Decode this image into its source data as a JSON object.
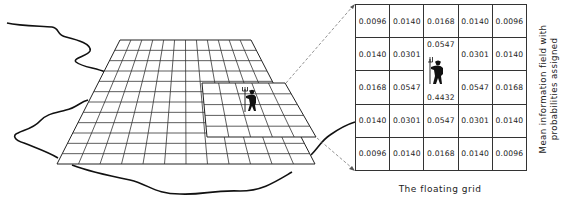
{
  "figure": {
    "caption": "The floating grid",
    "side_label_line1": "Mean information field with",
    "side_label_line2": "probabilities assigned"
  },
  "floating_grid": {
    "rows": [
      [
        "0.0096",
        "0.0140",
        "0.0168",
        "0.0140",
        "0.0096"
      ],
      [
        "0.0140",
        "0.0301",
        "0.0547",
        "0.0301",
        "0.0140"
      ],
      [
        "0.0168",
        "0.0547",
        "0.4432",
        "0.0547",
        "0.0168"
      ],
      [
        "0.0140",
        "0.0301",
        "0.0547",
        "0.0301",
        "0.0140"
      ],
      [
        "0.0096",
        "0.0140",
        "0.0168",
        "0.0140",
        "0.0096"
      ]
    ],
    "center_top_label": "0.0547",
    "center_bottom_label": "0.4432"
  },
  "icons": {
    "figure": "farmer-with-pitchfork-icon"
  },
  "colors": {
    "ink": "#222222",
    "background": "#ffffff",
    "dash": "#777777"
  }
}
